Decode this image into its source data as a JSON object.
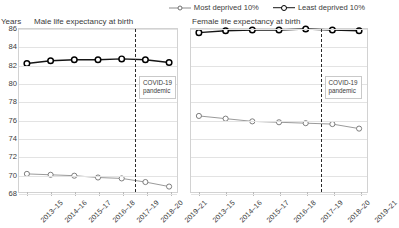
{
  "legend": {
    "items": [
      {
        "label": "Most deprived 10%",
        "key": "most",
        "color": "#6f6f6f"
      },
      {
        "label": "Least deprived 10%",
        "key": "least",
        "color": "#000000"
      }
    ]
  },
  "axis": {
    "ylabel": "Years",
    "yticks": [
      "86",
      "84",
      "82",
      "80",
      "78",
      "76",
      "74",
      "72",
      "70",
      "68"
    ]
  },
  "annotation": {
    "covid_line1": "COVID-19",
    "covid_line2": "pandemic"
  },
  "panels": [
    {
      "title": "Male life expectancy at birth"
    },
    {
      "title": "Female life expectancy at birth"
    }
  ],
  "chart_data": [
    {
      "type": "line",
      "title": "Male life expectancy at birth",
      "xlabel": "",
      "ylabel": "Years",
      "ylim": [
        68,
        86
      ],
      "yticks": [
        68,
        70,
        72,
        74,
        76,
        78,
        80,
        82,
        84,
        86
      ],
      "grid": true,
      "legend_position": "top-right",
      "categories": [
        "2013–15",
        "2014–16",
        "2015–17",
        "2016–18",
        "2017–19",
        "2018–20",
        "2019–21"
      ],
      "series": [
        {
          "name": "Least deprived 10%",
          "values": [
            82.2,
            82.5,
            82.6,
            82.6,
            82.7,
            82.6,
            82.3
          ]
        },
        {
          "name": "Most deprived 10%",
          "values": [
            70.0,
            69.9,
            69.8,
            69.6,
            69.5,
            69.1,
            68.6
          ]
        }
      ],
      "annotations": [
        {
          "text": "COVID-19 pandemic",
          "type": "vertical-dashed-line",
          "between": [
            "2017–19",
            "2018–20"
          ]
        }
      ]
    },
    {
      "type": "line",
      "title": "Female life expectancy at birth",
      "xlabel": "",
      "ylabel": "Years",
      "ylim": [
        68,
        86
      ],
      "yticks": [
        68,
        70,
        72,
        74,
        76,
        78,
        80,
        82,
        84,
        86
      ],
      "grid": true,
      "legend_position": "top-right",
      "categories": [
        "2013–15",
        "2014–16",
        "2015–17",
        "2016–18",
        "2017–19",
        "2018–20",
        "2019–21"
      ],
      "series": [
        {
          "name": "Least deprived 10%",
          "values": [
            85.6,
            85.8,
            85.9,
            85.9,
            86.0,
            85.9,
            85.8
          ]
        },
        {
          "name": "Most deprived 10%",
          "values": [
            76.4,
            76.1,
            75.8,
            75.7,
            75.6,
            75.5,
            75.0
          ]
        }
      ],
      "annotations": [
        {
          "text": "COVID-19 pandemic",
          "type": "vertical-dashed-line",
          "between": [
            "2017–19",
            "2018–20"
          ]
        }
      ]
    }
  ]
}
